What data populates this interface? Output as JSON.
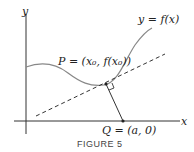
{
  "figure": {
    "caption": "FIGURE 5",
    "axes": {
      "x_label": "x",
      "y_label": "y"
    },
    "curve_label": "y = f(x)",
    "point_p_label": "P = (x₀, f(x₀))",
    "point_q_label": "Q = (a, 0)",
    "colors": {
      "curve": "#777777",
      "lines": "#333333"
    }
  }
}
